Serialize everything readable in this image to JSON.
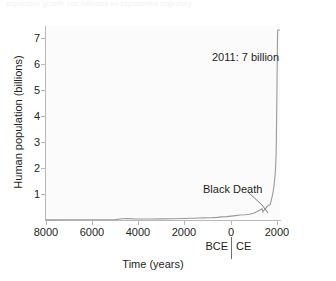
{
  "figure": {
    "faint_header": "population growth has followed an exponential trajectory",
    "credit": "Based on data from Population Reference Bureau."
  },
  "chart_data": {
    "type": "line",
    "title": "",
    "subtitle": "",
    "xlabel": "Time (years)",
    "ylabel": "Human population (billions)",
    "xlim": [
      -8000,
      2200
    ],
    "ylim": [
      0,
      7.4
    ],
    "grid": false,
    "legend_position": "none",
    "x_tick_values": [
      -8000,
      -6000,
      -4000,
      -2000,
      0,
      2000
    ],
    "x_tick_labels": [
      "8000",
      "6000",
      "4000",
      "2000",
      "0",
      "2000"
    ],
    "y_tick_values": [
      1,
      2,
      3,
      4,
      5,
      6,
      7
    ],
    "y_tick_labels": [
      "1",
      "2",
      "3",
      "4",
      "5",
      "6",
      "7"
    ],
    "era_labels": {
      "left": "BCE",
      "right": "CE",
      "divider_at": 0
    },
    "series": [
      {
        "name": "Human population",
        "color": "#9a9a9a",
        "x": [
          -8000,
          -7500,
          -7000,
          -6500,
          -6000,
          -5500,
          -5000,
          -4700,
          -4500,
          -4200,
          -4000,
          -3500,
          -3000,
          -2500,
          -2000,
          -1800,
          -1600,
          -1400,
          -1200,
          -1000,
          -800,
          -600,
          -400,
          -200,
          0,
          200,
          400,
          600,
          800,
          1000,
          1200,
          1300,
          1340,
          1380,
          1400,
          1500,
          1600,
          1700,
          1750,
          1800,
          1850,
          1900,
          1927,
          1950,
          1960,
          1974,
          1987,
          1999,
          2011,
          2020,
          2100
        ],
        "y": [
          0.005,
          0.006,
          0.007,
          0.008,
          0.01,
          0.012,
          0.015,
          0.05,
          0.06,
          0.045,
          0.04,
          0.04,
          0.045,
          0.05,
          0.06,
          0.065,
          0.07,
          0.075,
          0.08,
          0.085,
          0.09,
          0.1,
          0.12,
          0.13,
          0.15,
          0.17,
          0.19,
          0.2,
          0.22,
          0.27,
          0.36,
          0.4,
          0.44,
          0.3,
          0.35,
          0.45,
          0.55,
          0.6,
          0.79,
          0.98,
          1.26,
          1.65,
          2.0,
          2.5,
          3.0,
          4.0,
          5.0,
          6.0,
          7.0,
          7.8,
          7.9
        ],
        "annotations": [
          {
            "label": "2011: 7 billion",
            "x": 2011,
            "y": 7.0
          },
          {
            "label": "Black Death",
            "x": 1348,
            "y": 0.37
          }
        ]
      }
    ]
  }
}
